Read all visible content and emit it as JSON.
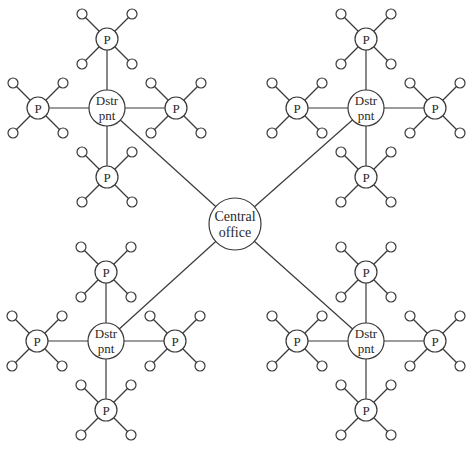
{
  "diagram": {
    "title": "",
    "colors": {
      "stroke": "#3a3a3a",
      "fill": "#ffffff",
      "text": "#2a2a2a"
    },
    "central": {
      "label_line1": "Central",
      "label_line2": "office",
      "x": 235,
      "y": 224,
      "r": 26
    },
    "dstr_label_line1": "Dstr",
    "dstr_label_line2": "pnt",
    "p_label": "P",
    "dstr_radius": 18,
    "p_radius": 11,
    "leaf_radius": 5,
    "p_offset": 69,
    "leaf_offset": 25,
    "clusters": [
      {
        "name": "top-left",
        "x": 107,
        "y": 108
      },
      {
        "name": "top-right",
        "x": 366,
        "y": 108
      },
      {
        "name": "bottom-left",
        "x": 106,
        "y": 341
      },
      {
        "name": "bottom-right",
        "x": 366,
        "y": 341
      }
    ]
  }
}
